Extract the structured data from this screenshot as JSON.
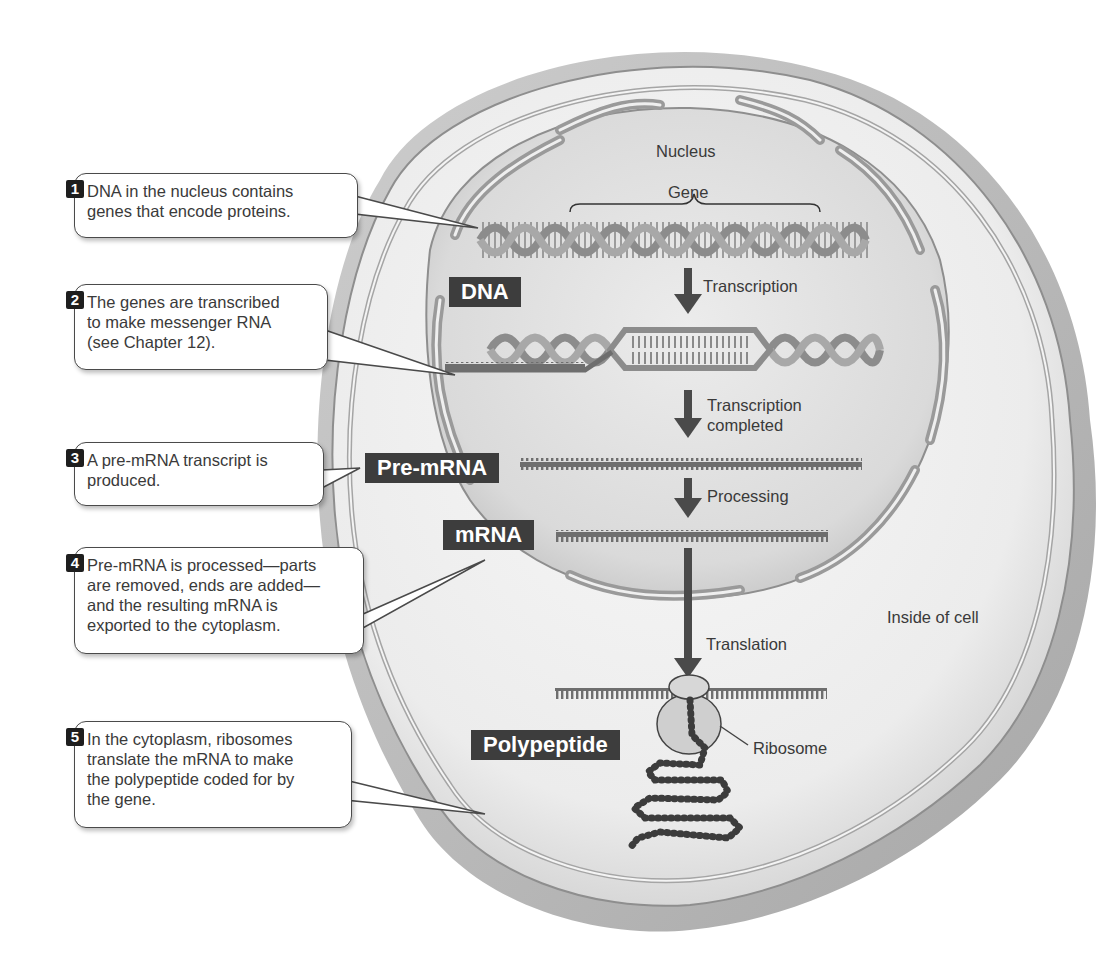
{
  "diagram": {
    "region_labels": {
      "nucleus": "Nucleus",
      "gene": "Gene",
      "inside_of_cell": "Inside of cell",
      "ribosome": "Ribosome"
    },
    "molecule_tags": {
      "dna": "DNA",
      "pre_mrna": "Pre-mRNA",
      "mrna": "mRNA",
      "polypeptide": "Polypeptide"
    },
    "process_arrows": [
      {
        "label": "Transcription"
      },
      {
        "label_line1": "Transcription",
        "label_line2": "completed"
      },
      {
        "label": "Processing"
      },
      {
        "label": "Translation"
      }
    ],
    "steps": [
      {
        "number": "1",
        "lines": [
          "DNA in the nucleus contains",
          "genes that encode proteins."
        ]
      },
      {
        "number": "2",
        "lines": [
          "The genes are transcribed",
          "to make messenger RNA",
          "(see Chapter 12)."
        ]
      },
      {
        "number": "3",
        "lines": [
          "A pre-mRNA transcript is",
          "produced."
        ]
      },
      {
        "number": "4",
        "lines": [
          "Pre-mRNA is processed—parts",
          "are removed, ends are added—",
          "and the resulting mRNA is",
          "exported to the cytoplasm."
        ]
      },
      {
        "number": "5",
        "lines": [
          "In the cytoplasm, ribosomes",
          "translate the mRNA to make",
          "the polypeptide coded for by",
          "the gene."
        ]
      }
    ],
    "colors": {
      "cell_outer": "#d9d9d9",
      "cell_inner": "#f2f2f2",
      "nucleus_fill": "#cfcfcf",
      "membrane": "#9a9a9a",
      "tag_bg": "#3d3d3d",
      "arrow": "#4a4a4a",
      "strand": "#7a7a7a"
    }
  }
}
